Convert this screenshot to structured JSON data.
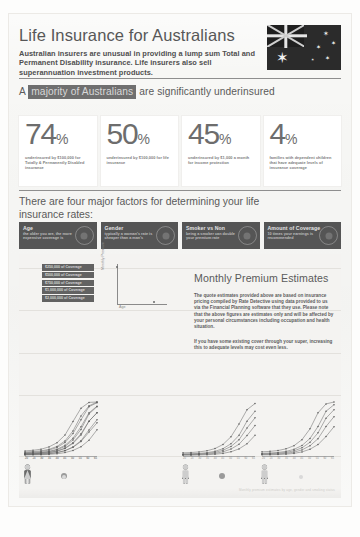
{
  "header": {
    "title": "Life Insurance for Australians",
    "subtitle": "Australian insurers are unusual in providing a lump sum Total and Permanent Disability insurance. Life insurers also sell superannuation investment products.",
    "flag_icon": "australian-flag-icon"
  },
  "highlight": {
    "prefix": "A",
    "highlighted": "majority of Australians",
    "suffix": "are significantly underinsured",
    "highlight_color": "#6f6f6f"
  },
  "stats": [
    {
      "value": "74",
      "unit": "%",
      "caption": "underinsured by $100,000 for Totally & Permanently Disabled insurance"
    },
    {
      "value": "50",
      "unit": "%",
      "caption": "underinsured by $100,000 for life insurance"
    },
    {
      "value": "45",
      "unit": "%",
      "caption": "underinsured by $1,000 a month for income protection"
    },
    {
      "value": "4",
      "unit": "%",
      "caption": "families with dependent children that have adequate levels of insurance coverage"
    }
  ],
  "factors": {
    "title": "There are four major factors for determining your life insurance rates:",
    "cards": [
      {
        "title": "Age",
        "desc": "the older you are, the more expensive coverage is",
        "icon": "calendar-icon"
      },
      {
        "title": "Gender",
        "desc": "typically a woman's rate is cheaper than a man's",
        "icon": "gender-icon"
      },
      {
        "title": "Smoker vs Non",
        "desc": "being a smoker can double your premium rate",
        "icon": "cigarette-icon"
      },
      {
        "title": "Amount of Coverage",
        "desc": "10 times your earnings is recommended",
        "icon": "coverage-icon"
      }
    ]
  },
  "estimates": {
    "title": "Monthly Premium Estimates",
    "paragraph1": "The quote estimates provided above are based on insurance pricing compiled by Rate Detective using data provided to us via the Financial Planning software that they use. Please note that the above figures are estimates only and will be affected by your personal circumstances including occupation and health situation.",
    "paragraph2": "If you have some existing cover through your super, increasing this to adequate levels may cost even less.",
    "footnote": "Monthly premium estimates by age, gender and smoking status"
  },
  "chart_data": {
    "type": "line",
    "title": "Monthly Premium Estimates",
    "xlabel": "Age",
    "ylabel": "Monthly Premium",
    "legend_position": "top-left",
    "legend": [
      "$250,000 of Coverage",
      "$500,000 of Coverage",
      "$750,000 of Coverage",
      "$1,000,000 of Coverage",
      "$2,000,000 of Coverage"
    ],
    "x": [
      20,
      25,
      30,
      35,
      40,
      45,
      50,
      55,
      60,
      65
    ],
    "xlim": [
      20,
      65
    ],
    "ylim": [
      0,
      700
    ],
    "panels": [
      {
        "label": "Male Non-Smoker",
        "gender": "male",
        "smoker": false,
        "series": [
          {
            "name": "$250,000 of Coverage",
            "values": [
              14,
              15,
              17,
              21,
              29,
              44,
              72,
              120,
              205,
              340
            ]
          },
          {
            "name": "$500,000 of Coverage",
            "values": [
              20,
              22,
              25,
              32,
              45,
              70,
              118,
              198,
              338,
              470
            ]
          },
          {
            "name": "$750,000 of Coverage",
            "values": [
              27,
              30,
              34,
              44,
              62,
              97,
              163,
              272,
              452,
              560
            ]
          },
          {
            "name": "$1,000,000 of Coverage",
            "values": [
              34,
              38,
              43,
              56,
              79,
              124,
              208,
              345,
              545,
              640
            ]
          },
          {
            "name": "$2,000,000 of Coverage",
            "values": [
              52,
              58,
              67,
              87,
              124,
              195,
              325,
              520,
              650,
              700
            ]
          }
        ]
      },
      {
        "label": "Male Smoker",
        "gender": "male",
        "smoker": true,
        "series": [
          {
            "name": "$250,000 of Coverage",
            "values": [
              18,
              20,
              23,
              30,
              43,
              68,
              112,
              188,
              310,
              430
            ]
          },
          {
            "name": "$500,000 of Coverage",
            "values": [
              26,
              29,
              34,
              45,
              65,
              103,
              172,
              288,
              452,
              560
            ]
          },
          {
            "name": "$750,000 of Coverage",
            "values": [
              34,
              38,
              45,
              60,
              87,
              138,
              230,
              380,
              560,
              645
            ]
          },
          {
            "name": "$1,000,000 of Coverage",
            "values": [
              43,
              48,
              57,
              76,
              110,
              175,
              292,
              470,
              640,
              690
            ]
          },
          {
            "name": "$2,000,000 of Coverage",
            "values": [
              66,
              74,
              88,
              118,
              172,
              272,
              448,
              620,
              695,
              700
            ]
          }
        ]
      },
      {
        "label": "Female Non-Smoker",
        "gender": "female",
        "smoker": false,
        "series": [
          {
            "name": "$250,000 of Coverage",
            "values": [
              11,
              12,
              14,
              17,
              23,
              34,
              55,
              92,
              158,
              268
            ]
          },
          {
            "name": "$500,000 of Coverage",
            "values": [
              16,
              17,
              20,
              25,
              35,
              54,
              90,
              152,
              265,
              395
            ]
          },
          {
            "name": "$750,000 of Coverage",
            "values": [
              21,
              23,
              27,
              34,
              48,
              74,
              124,
              210,
              362,
              495
            ]
          },
          {
            "name": "$1,000,000 of Coverage",
            "values": [
              26,
              29,
              34,
              43,
              61,
              95,
              159,
              268,
              452,
              580
            ]
          },
          {
            "name": "$2,000,000 of Coverage",
            "values": [
              41,
              45,
              53,
              68,
              96,
              150,
              250,
              415,
              600,
              680
            ]
          }
        ]
      },
      {
        "label": "Female Smoker",
        "gender": "female",
        "smoker": true,
        "series": [
          {
            "name": "$250,000 of Coverage",
            "values": [
              15,
              16,
              19,
              24,
              34,
              53,
              88,
              148,
              252,
              380
            ]
          },
          {
            "name": "$500,000 of Coverage",
            "values": [
              21,
              23,
              27,
              35,
              50,
              79,
              133,
              224,
              382,
              510
            ]
          },
          {
            "name": "$750,000 of Coverage",
            "values": [
              28,
              31,
              36,
              47,
              67,
              106,
              178,
              300,
              490,
              600
            ]
          },
          {
            "name": "$1,000,000 of Coverage",
            "values": [
              35,
              39,
              46,
              60,
              86,
              136,
              228,
              382,
              580,
              665
            ]
          },
          {
            "name": "$2,000,000 of Coverage",
            "values": [
              54,
              60,
              71,
              93,
              134,
              212,
              352,
              560,
              675,
              700
            ]
          }
        ]
      }
    ]
  }
}
